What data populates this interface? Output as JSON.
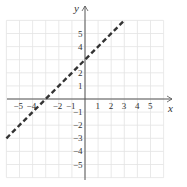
{
  "chart_data": {
    "type": "line",
    "title": "",
    "xlabel": "x",
    "ylabel": "y",
    "xlim": [
      -6,
      6
    ],
    "ylim": [
      -6,
      6
    ],
    "grid": true,
    "x_ticks": [
      "-5",
      "-4",
      "-2",
      "-1",
      "1",
      "2",
      "3",
      "4",
      "5"
    ],
    "y_ticks": [
      "5",
      "4",
      "2",
      "1",
      "-1",
      "-2",
      "-3",
      "-4",
      "-5"
    ],
    "series": [
      {
        "name": "y = x + 3",
        "style": "dashed",
        "color": "#333333",
        "x": [
          -6,
          3
        ],
        "y": [
          -3,
          6
        ]
      }
    ],
    "annotations": []
  },
  "labels": {
    "x_axis": "x",
    "y_axis": "y"
  },
  "colors": {
    "grid": "#e3e3e3",
    "axis": "#555555",
    "line": "#333333"
  }
}
